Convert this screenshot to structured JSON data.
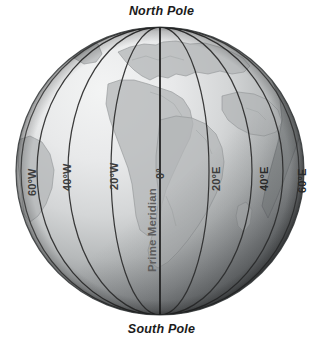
{
  "figure": {
    "title_top": "North Pole",
    "title_bottom": "South Pole",
    "background_color": "#ffffff"
  },
  "globe": {
    "center_x": 160,
    "center_y": 171,
    "radius": 144,
    "ocean_light_color": "#eceded",
    "ocean_mid_color": "#b9bcbd",
    "ocean_dark_color": "#4a4d4f",
    "land_color": "#a9acad",
    "coastline_color": "#8d9192",
    "meridian_color": "#2b2b2b",
    "prime_meridian_color": "#1a1a1a"
  },
  "labels": {
    "prime_meridian": "Prime Meridian",
    "meridians": [
      {
        "id": "m60w",
        "text": "60°W",
        "x": 27,
        "y": 196,
        "rotate": -90,
        "dark": false
      },
      {
        "id": "m40w",
        "text": "40°W",
        "x": 62,
        "y": 191,
        "rotate": -90,
        "dark": false
      },
      {
        "id": "m20w",
        "text": "20°W",
        "x": 109,
        "y": 190,
        "rotate": -90,
        "dark": false
      },
      {
        "id": "m0",
        "text": "0°",
        "x": 155,
        "y": 179,
        "rotate": -90,
        "dark": false
      },
      {
        "id": "m20e",
        "text": "20°E",
        "x": 211,
        "y": 191,
        "rotate": -90,
        "dark": false
      },
      {
        "id": "m40e",
        "text": "40°E",
        "x": 259,
        "y": 191,
        "rotate": -90,
        "dark": true
      },
      {
        "id": "m60e",
        "text": "60°E",
        "x": 297,
        "y": 193,
        "rotate": -90,
        "dark": true
      }
    ],
    "prime_meridian_position": {
      "x": 147,
      "y": 272,
      "rotate": -90
    }
  }
}
